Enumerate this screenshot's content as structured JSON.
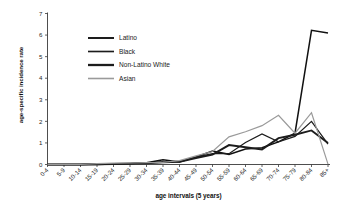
{
  "chart_data": {
    "type": "line",
    "title": "",
    "xlabel": "age intervals (5 years)",
    "ylabel": "age-specific incidence rate",
    "ylim": [
      0,
      7
    ],
    "yticks": [
      0,
      1,
      2,
      3,
      4,
      5,
      6,
      7
    ],
    "grid": false,
    "legend_position": "upper-left-inside",
    "categories": [
      "0-4",
      "5-9",
      "10-14",
      "15-19",
      "20-24",
      "25-29",
      "30-34",
      "35-39",
      "40-44",
      "45-49",
      "50-54",
      "55-59",
      "60-64",
      "65-69",
      "70-74",
      "75-79",
      "80-84",
      "85+"
    ],
    "series": [
      {
        "name": "Latino",
        "color": "#111111",
        "width": 1.5,
        "values": [
          0.0,
          0.0,
          0.0,
          0.02,
          0.03,
          0.05,
          0.08,
          0.22,
          0.12,
          0.35,
          0.62,
          0.47,
          0.72,
          0.78,
          1.05,
          1.45,
          6.22,
          6.1
        ]
      },
      {
        "name": "Black",
        "color": "#1c1c1c",
        "width": 1.25,
        "values": [
          0.0,
          0.0,
          0.0,
          0.0,
          0.02,
          0.04,
          0.07,
          0.12,
          0.14,
          0.34,
          0.5,
          0.5,
          1.02,
          1.42,
          1.05,
          1.3,
          2.0,
          0.95
        ]
      },
      {
        "name": "Non-Latino White",
        "color": "#1c1c1c",
        "width": 1.9,
        "values": [
          0.0,
          0.0,
          0.0,
          0.01,
          0.02,
          0.04,
          0.06,
          0.1,
          0.12,
          0.3,
          0.46,
          0.9,
          0.8,
          0.7,
          1.22,
          1.38,
          1.58,
          1.0
        ]
      },
      {
        "name": "Asian",
        "color": "#9a9a9a",
        "width": 1.2,
        "values": [
          0.0,
          0.0,
          0.0,
          0.04,
          0.06,
          0.07,
          0.09,
          0.1,
          0.18,
          0.4,
          0.6,
          1.28,
          1.52,
          1.8,
          2.28,
          1.45,
          2.4,
          0.02
        ]
      }
    ]
  },
  "legend": {
    "items": [
      {
        "label": "Latino"
      },
      {
        "label": "Black"
      },
      {
        "label": "Non-Latino White"
      },
      {
        "label": "Asian"
      }
    ]
  }
}
